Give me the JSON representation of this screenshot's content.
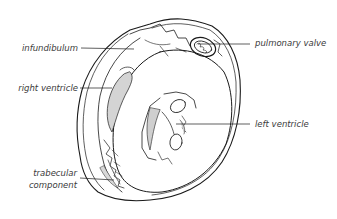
{
  "diagram": {
    "labels": {
      "infundibulum": "infundibulum",
      "right_ventricle": "right ventricle",
      "trabecular_line1": "trabecular",
      "trabecular_line2": "component",
      "pulmonary_valve": "pulmonary valve",
      "left_ventricle": "left ventricle"
    },
    "colors": {
      "ink": "#1a1a1a",
      "label_text": "#3a3a3a",
      "shading": "#cfcfcf",
      "background": "#ffffff"
    }
  }
}
